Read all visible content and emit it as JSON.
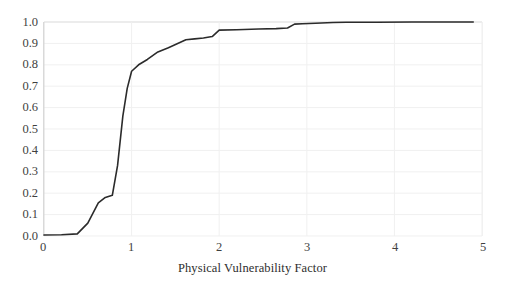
{
  "chart_data": {
    "type": "line",
    "title": "",
    "xlabel": "Physical Vulnerability Factor",
    "ylabel": "",
    "xlim": [
      0,
      5
    ],
    "ylim": [
      0.0,
      1.0
    ],
    "xticks": [
      "0",
      "1",
      "2",
      "3",
      "4",
      "5"
    ],
    "xtick_values": [
      0,
      1,
      2,
      3,
      4,
      5
    ],
    "yticks": [
      "0.0",
      "0.1",
      "0.2",
      "0.3",
      "0.4",
      "0.5",
      "0.6",
      "0.7",
      "0.8",
      "0.9",
      "1.0"
    ],
    "ytick_values": [
      0.0,
      0.1,
      0.2,
      0.3,
      0.4,
      0.5,
      0.6,
      0.7,
      0.8,
      0.9,
      1.0
    ],
    "grid": "horizontal-and-vertical",
    "legend": "none",
    "series": [
      {
        "name": "Cumulative distribution",
        "color": "#2b2b2b",
        "line_width": 1.6,
        "x": [
          0.0,
          0.2,
          0.38,
          0.5,
          0.62,
          0.7,
          0.78,
          0.84,
          0.9,
          0.95,
          1.0,
          1.08,
          1.18,
          1.3,
          1.42,
          1.52,
          1.62,
          1.72,
          1.82,
          1.92,
          2.0,
          2.2,
          2.45,
          2.65,
          2.78,
          2.86,
          2.95,
          3.1,
          3.3,
          3.45,
          3.8,
          4.2,
          4.6,
          4.9
        ],
        "y": [
          0.005,
          0.006,
          0.01,
          0.06,
          0.155,
          0.18,
          0.19,
          0.33,
          0.56,
          0.69,
          0.77,
          0.8,
          0.825,
          0.86,
          0.88,
          0.898,
          0.917,
          0.921,
          0.925,
          0.932,
          0.962,
          0.964,
          0.967,
          0.969,
          0.972,
          0.99,
          0.992,
          0.994,
          0.998,
          0.999,
          0.999,
          1.0,
          1.0,
          1.0
        ]
      }
    ]
  },
  "axis": {
    "x_title": "Physical Vulnerability Factor"
  },
  "style": {
    "grid_color": "#f0f0f0",
    "axis_line_color": "#d9d9d9",
    "line_color": "#2b2b2b",
    "text_color": "#3f3f3f",
    "background": "#ffffff"
  }
}
